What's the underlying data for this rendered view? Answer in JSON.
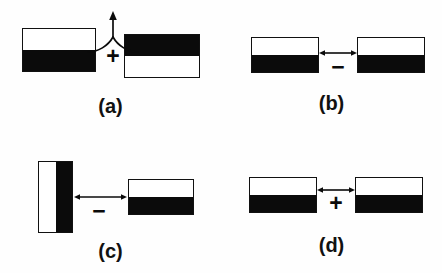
{
  "figure": {
    "background_color": "#fefefe",
    "ink_color": "#0b0b0b",
    "outline_color": "#111111",
    "panels": [
      {
        "id": "a",
        "caption": "(a)",
        "operator": "+",
        "operator_symbol": "+",
        "connector": "converging-curves-up-arrow",
        "left_block": {
          "name": "block-white-top-black-bottom",
          "orientation": "horizontal",
          "top_half": "white",
          "bottom_half": "black"
        },
        "right_block": {
          "name": "block-black-top-white-bottom",
          "orientation": "horizontal",
          "top_half": "black",
          "bottom_half": "white"
        }
      },
      {
        "id": "b",
        "caption": "(b)",
        "operator": "−",
        "operator_symbol": "−",
        "connector": "double-headed-horizontal-arrow",
        "left_block": {
          "name": "block-white-top-black-bottom",
          "orientation": "horizontal",
          "top_half": "white",
          "bottom_half": "black"
        },
        "right_block": {
          "name": "block-white-top-black-bottom",
          "orientation": "horizontal",
          "top_half": "white",
          "bottom_half": "black"
        }
      },
      {
        "id": "c",
        "caption": "(c)",
        "operator": "−",
        "operator_symbol": "−",
        "connector": "double-headed-horizontal-arrow",
        "left_block": {
          "name": "block-white-left-black-right",
          "orientation": "vertical",
          "left_half": "white",
          "right_half": "black"
        },
        "right_block": {
          "name": "block-white-top-black-bottom",
          "orientation": "horizontal",
          "top_half": "white",
          "bottom_half": "black"
        }
      },
      {
        "id": "d",
        "caption": "(d)",
        "operator": "+",
        "operator_symbol": "+",
        "connector": "double-headed-horizontal-arrow",
        "left_block": {
          "name": "block-white-top-black-bottom",
          "orientation": "horizontal",
          "top_half": "white",
          "bottom_half": "black"
        },
        "right_block": {
          "name": "block-white-top-black-bottom",
          "orientation": "horizontal",
          "top_half": "white",
          "bottom_half": "black"
        }
      }
    ]
  }
}
